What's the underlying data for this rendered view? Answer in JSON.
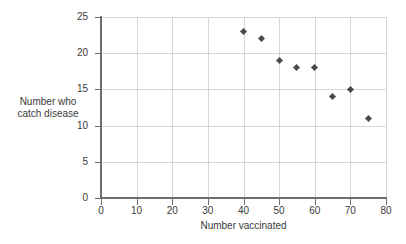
{
  "chart_data": {
    "type": "scatter",
    "title": "",
    "xlabel": "Number vaccinated",
    "ylabel": "Number who\ncatch disease",
    "ylabel_line1": "Number who",
    "ylabel_line2": "catch disease",
    "xlim": [
      0,
      80
    ],
    "ylim": [
      0,
      25
    ],
    "xticks": [
      0,
      10,
      20,
      30,
      40,
      50,
      60,
      70,
      80
    ],
    "yticks": [
      0,
      5,
      10,
      15,
      20,
      25
    ],
    "xtick_labels": [
      "0",
      "10",
      "20",
      "30",
      "40",
      "50",
      "60",
      "70",
      "80"
    ],
    "ytick_labels": [
      "0",
      "5",
      "10",
      "15",
      "20",
      "25"
    ],
    "grid": true,
    "legend": false,
    "marker": "diamond",
    "marker_color": "#4a4a4a",
    "grid_color": "#d6d6d6",
    "axis_color": "#6e6e6e",
    "background": "#ffffff",
    "x": [
      40,
      45,
      50,
      55,
      60,
      65,
      70,
      75
    ],
    "y": [
      23,
      22,
      19,
      18,
      18,
      14,
      15,
      11
    ],
    "points": [
      {
        "x": 40,
        "y": 23
      },
      {
        "x": 45,
        "y": 22
      },
      {
        "x": 50,
        "y": 19
      },
      {
        "x": 55,
        "y": 18
      },
      {
        "x": 60,
        "y": 18
      },
      {
        "x": 65,
        "y": 14
      },
      {
        "x": 70,
        "y": 15
      },
      {
        "x": 75,
        "y": 11
      }
    ]
  }
}
